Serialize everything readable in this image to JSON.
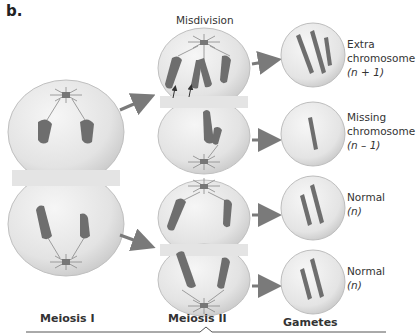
{
  "figure": {
    "panel_label": "b.",
    "title": "Misdivision",
    "stages": [
      "Meiosis I",
      "Meiosis II",
      "Gametes"
    ],
    "gametes": [
      {
        "line1": "Extra",
        "line2": "chromosome",
        "formula": "(n + 1)",
        "chromosome_count": 3
      },
      {
        "line1": "Missing",
        "line2": "chromosome",
        "formula": "(n – 1)",
        "chromosome_count": 1
      },
      {
        "line1": "Normal",
        "line2": "",
        "formula": "(n)",
        "chromosome_count": 2
      },
      {
        "line1": "Normal",
        "line2": "",
        "formula": "(n)",
        "chromosome_count": 2
      }
    ],
    "colors": {
      "cell_fill": "#e6e6e6",
      "cell_edge": "#bdbdbd",
      "chromosome": "#6e6e6e",
      "arrow": "#7a7a7a",
      "text": "#333333"
    }
  }
}
